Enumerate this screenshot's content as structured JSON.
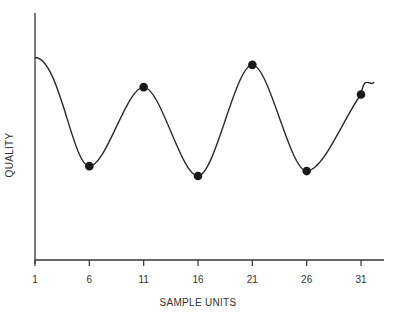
{
  "chart_data": {
    "type": "line",
    "title": "",
    "xlabel": "SAMPLE UNITS",
    "ylabel": "QUALITY",
    "x_ticks": [
      1,
      6,
      11,
      16,
      21,
      26,
      31
    ],
    "x_tick_labels": [
      "1",
      "6",
      "11",
      "16",
      "21",
      "26",
      "31"
    ],
    "xlim": [
      1,
      34
    ],
    "ylim": [
      0,
      100
    ],
    "y_ticks_shown": false,
    "grid": false,
    "legend": null,
    "series": [
      {
        "name": "quality curve",
        "style": "smooth line",
        "x": [
          1,
          6,
          11,
          16,
          21,
          26,
          31,
          32.2
        ],
        "y": [
          82,
          38,
          70,
          34,
          79,
          36,
          67,
          72
        ]
      },
      {
        "name": "sampled points",
        "style": "markers",
        "x": [
          6,
          11,
          16,
          21,
          26,
          31
        ],
        "y": [
          38,
          70,
          34,
          79,
          36,
          67
        ]
      }
    ],
    "colors": {
      "line": "#2b2b2b",
      "marker": "#1a1a1a",
      "axis": "#333333"
    }
  }
}
